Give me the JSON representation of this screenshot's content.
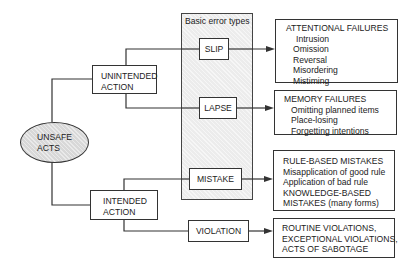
{
  "diagram": {
    "root": {
      "label_line1": "UNSAFE",
      "label_line2": "ACTS"
    },
    "branches": {
      "unintended": {
        "line1": "UNINTENDED",
        "line2": "ACTION"
      },
      "intended": {
        "line1": "INTENDED",
        "line2": "ACTION"
      }
    },
    "basic_error_types": {
      "title": "Basic error types",
      "items": [
        "SLIP",
        "LAPSE",
        "MISTAKE"
      ]
    },
    "violation": "VIOLATION",
    "outcomes": {
      "slip": {
        "title": "ATTENTIONAL FAILURES",
        "items": [
          "Intrusion",
          "Omission",
          "Reversal",
          "Misordering",
          "Mistiming"
        ]
      },
      "lapse": {
        "title": "MEMORY FAILURES",
        "items": [
          "Omitting planned items",
          "Place-losing",
          "Forgetting intentions"
        ]
      },
      "mistake": {
        "lines": [
          "RULE-BASED MISTAKES",
          "Misapplication of good rule",
          "Application of bad rule",
          "KNOWLEDGE-BASED",
          "MISTAKES (many forms)"
        ]
      },
      "violation": {
        "lines": [
          "ROUTINE VIOLATIONS,",
          "EXCEPTIONAL VIOLATIONS,",
          "ACTS OF SABOTAGE"
        ]
      }
    },
    "colors": {
      "line": "#333333",
      "shade": "#ececec",
      "ellipse": "#d8d8d8"
    }
  }
}
